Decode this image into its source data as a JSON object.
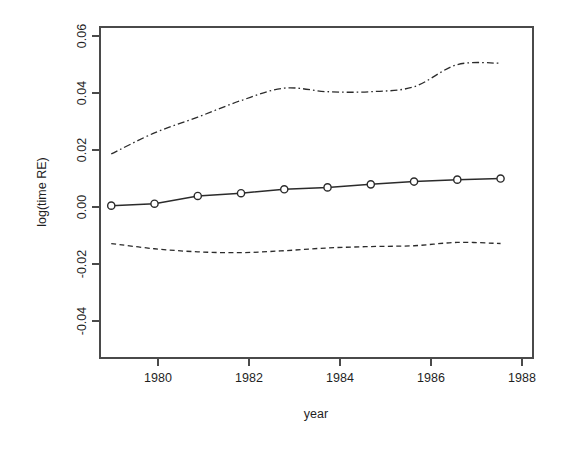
{
  "chart_data": {
    "type": "line",
    "title": "",
    "subtitle": "",
    "xlabel": "year",
    "ylabel": "log(time RE)",
    "xlim": [
      1978.74,
      1988.75
    ],
    "ylim": [
      -0.0526,
      0.0671
    ],
    "grid": false,
    "legend": "none",
    "x": [
      1979,
      1980,
      1981,
      1982,
      1983,
      1984,
      1985,
      1986,
      1987,
      1988
    ],
    "xticks": [
      1980,
      1982,
      1984,
      1986,
      1988
    ],
    "xticklabels": [
      "1980",
      "1982",
      "1984",
      "1986",
      "1988"
    ],
    "yticks": [
      0.06,
      0.04,
      0.02,
      0.0,
      -0.02,
      -0.04
    ],
    "yticklabels": [
      "0.06",
      "0.04",
      "0.02",
      "0.00",
      "-0.02",
      "-0.04"
    ],
    "series": [
      {
        "name": "estimate",
        "style": "solid-with-circles",
        "marker": "open-circle",
        "color": "#2b2b2b",
        "values": [
          0.0025,
          0.0032,
          0.006,
          0.007,
          0.0084,
          0.0091,
          0.0102,
          0.0112,
          0.0119,
          0.0123
        ]
      },
      {
        "name": "upper-band",
        "style": "dash-dot",
        "marker": "none",
        "color": "#2b2b2b",
        "values": [
          0.0212,
          0.0288,
          0.0345,
          0.0405,
          0.045,
          0.0437,
          0.0437,
          0.0455,
          0.0535,
          0.054
        ]
      },
      {
        "name": "lower-band",
        "style": "dashed",
        "marker": "none",
        "color": "#2b2b2b",
        "values": [
          -0.0112,
          -0.0131,
          -0.0142,
          -0.0145,
          -0.0138,
          -0.0128,
          -0.0123,
          -0.012,
          -0.0108,
          -0.0112
        ]
      }
    ]
  },
  "axes": {
    "y_axis_title": "log(time RE)",
    "x_axis_title": "year"
  }
}
